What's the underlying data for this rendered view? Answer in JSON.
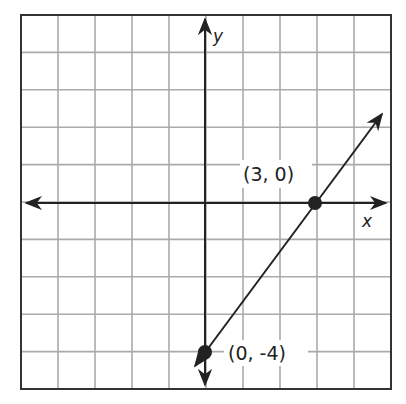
{
  "graph": {
    "axes": {
      "x_label": "x",
      "y_label": "y"
    },
    "grid": {
      "cols": 10,
      "rows": 10,
      "x_range": [
        -5,
        5
      ],
      "y_range": [
        -5,
        5
      ]
    },
    "points": [
      {
        "label": "(3, 0)",
        "x": 3,
        "y": 0
      },
      {
        "label": "(0, -4)",
        "x": 0,
        "y": -4
      }
    ],
    "line": {
      "slope": "4/3",
      "y_intercept": -4
    }
  },
  "chart_data": {
    "type": "line",
    "title": "",
    "xlabel": "x",
    "ylabel": "y",
    "xlim": [
      -5,
      5
    ],
    "ylim": [
      -5,
      5
    ],
    "grid": true,
    "series": [
      {
        "name": "line",
        "x": [
          0,
          3
        ],
        "y": [
          -4,
          0
        ]
      }
    ],
    "annotations": [
      "(3, 0)",
      "(0, -4)"
    ]
  }
}
